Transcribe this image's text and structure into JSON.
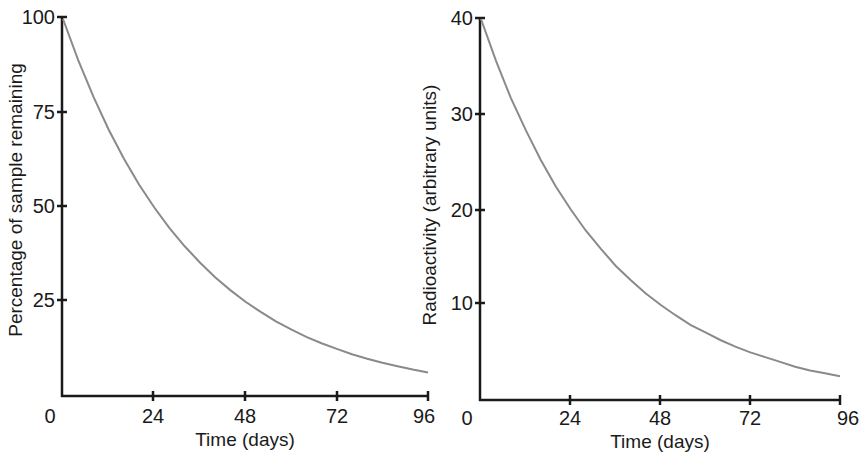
{
  "chart_data": [
    {
      "type": "line",
      "title": "",
      "xlabel": "Time (days)",
      "ylabel": "Percentage of sample remaining",
      "xlim": [
        0,
        96
      ],
      "ylim": [
        0,
        100
      ],
      "x_ticks": [
        0,
        24,
        48,
        72,
        96
      ],
      "y_ticks": [
        25,
        50,
        75,
        100
      ],
      "grid": false,
      "legend": null,
      "series": [
        {
          "name": "Percentage remaining",
          "color": "#8a8a8a",
          "x": [
            0,
            4,
            8,
            12,
            16,
            20,
            24,
            28,
            32,
            36,
            40,
            44,
            48,
            52,
            56,
            60,
            64,
            68,
            72,
            76,
            80,
            84,
            88,
            92,
            96
          ],
          "values": [
            100,
            89.1,
            79.4,
            70.7,
            63.0,
            56.1,
            50.0,
            44.5,
            39.7,
            35.4,
            31.5,
            28.1,
            25.0,
            22.3,
            19.8,
            17.7,
            15.7,
            14.0,
            12.5,
            11.1,
            9.9,
            8.8,
            7.9,
            7.0,
            6.25
          ]
        }
      ]
    },
    {
      "type": "line",
      "title": "",
      "xlabel": "Time (days)",
      "ylabel": "Radioactivity (arbitrary units)",
      "xlim": [
        0,
        96
      ],
      "ylim": [
        0,
        40
      ],
      "x_ticks": [
        0,
        24,
        48,
        72,
        96
      ],
      "y_ticks": [
        10,
        20,
        30,
        40
      ],
      "grid": false,
      "legend": null,
      "series": [
        {
          "name": "Radioactivity",
          "color": "#8a8a8a",
          "x": [
            0,
            4,
            8,
            12,
            16,
            20,
            24,
            28,
            32,
            36,
            40,
            44,
            48,
            52,
            56,
            60,
            64,
            68,
            72,
            76,
            80,
            84,
            88,
            92,
            96
          ],
          "values": [
            40,
            35.6,
            31.7,
            28.3,
            25.2,
            22.4,
            20.0,
            17.8,
            15.9,
            14.1,
            12.6,
            11.2,
            10.0,
            8.9,
            7.9,
            7.1,
            6.3,
            5.6,
            5.0,
            4.5,
            4.0,
            3.5,
            3.1,
            2.8,
            2.5
          ]
        }
      ]
    }
  ],
  "left_chart": {
    "x_label": "Time (days)",
    "y_label": "Percentage of sample remaining",
    "x_tick_labels": [
      "0",
      "24",
      "48",
      "72",
      "96"
    ],
    "y_tick_labels": [
      "25",
      "50",
      "75",
      "100"
    ]
  },
  "right_chart": {
    "x_label": "Time (days)",
    "y_label": "Radioactivity (arbitrary units)",
    "x_tick_labels": [
      "0",
      "24",
      "48",
      "72",
      "96"
    ],
    "y_tick_labels": [
      "10",
      "20",
      "30",
      "40"
    ]
  }
}
